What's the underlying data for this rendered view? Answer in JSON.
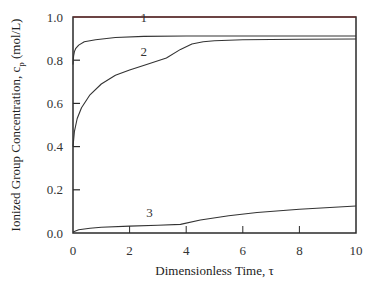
{
  "chart_data": {
    "type": "line",
    "title": "",
    "xlabel": "Dimensionless Time, τ",
    "ylabel": "Ionized Group Concentration, c_p (mol/L)",
    "ylabel_main": "Ionized Group Concentration, c",
    "ylabel_sub": "p",
    "ylabel_unit": " (mol/L)",
    "xlim": [
      0,
      10
    ],
    "ylim": [
      0.0,
      1.0
    ],
    "xticks": [
      0,
      2,
      4,
      6,
      8,
      10
    ],
    "xtick_labels": [
      "0",
      "2",
      "4",
      "6",
      "8",
      "10"
    ],
    "yticks": [
      0.0,
      0.2,
      0.4,
      0.6,
      0.8,
      1.0
    ],
    "ytick_labels": [
      "0.0",
      "0.2",
      "0.4",
      "0.6",
      "0.8",
      "1.0"
    ],
    "grid": false,
    "legend": "none (curves labeled inline)",
    "series": [
      {
        "name": "1",
        "label_pos": {
          "x": 2.5,
          "y": 0.975
        },
        "x": [
          0,
          0.02,
          0.05,
          0.1,
          0.2,
          0.4,
          0.8,
          1.5,
          2.5,
          4,
          6,
          8,
          10
        ],
        "y": [
          0.78,
          0.82,
          0.84,
          0.855,
          0.87,
          0.885,
          0.895,
          0.905,
          0.91,
          0.912,
          0.912,
          0.912,
          0.912
        ]
      },
      {
        "name": "2",
        "label_pos": {
          "x": 2.5,
          "y": 0.82
        },
        "x": [
          0,
          0.05,
          0.15,
          0.3,
          0.6,
          1.0,
          1.5,
          2.0,
          2.6,
          3.3,
          3.8,
          4.2,
          4.6,
          5,
          6,
          8,
          10
        ],
        "y": [
          0.4,
          0.47,
          0.53,
          0.58,
          0.64,
          0.69,
          0.73,
          0.755,
          0.78,
          0.81,
          0.85,
          0.875,
          0.885,
          0.89,
          0.895,
          0.897,
          0.898
        ]
      },
      {
        "name": "3",
        "label_pos": {
          "x": 2.7,
          "y": 0.075
        },
        "x": [
          0,
          0.2,
          0.6,
          1.0,
          2.0,
          3.0,
          3.8,
          4.5,
          5.5,
          6.5,
          8,
          10
        ],
        "y": [
          0.005,
          0.015,
          0.022,
          0.027,
          0.032,
          0.036,
          0.04,
          0.06,
          0.08,
          0.095,
          0.11,
          0.125
        ]
      }
    ]
  }
}
